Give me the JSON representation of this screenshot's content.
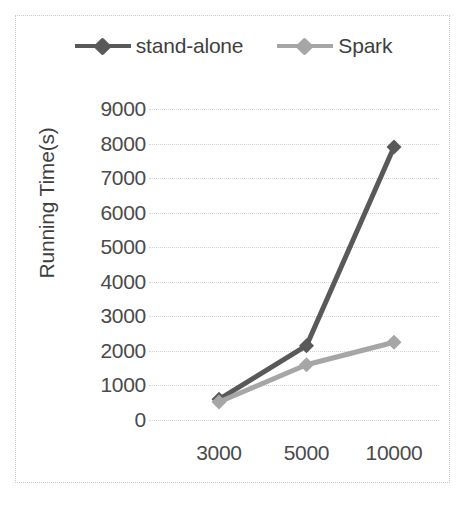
{
  "chart_data": {
    "type": "line",
    "title": "",
    "xlabel": "",
    "ylabel": "Running Time(s)",
    "categories": [
      "3000",
      "5000",
      "10000"
    ],
    "series": [
      {
        "name": "stand-alone",
        "values": [
          600,
          2150,
          7900
        ],
        "color": "#595959"
      },
      {
        "name": "Spark",
        "values": [
          520,
          1600,
          2250
        ],
        "color": "#a6a6a6"
      }
    ],
    "ylim": [
      0,
      9000
    ],
    "y_ticks": [
      "0",
      "1000",
      "2000",
      "3000",
      "4000",
      "5000",
      "6000",
      "7000",
      "8000",
      "9000"
    ],
    "grid": true,
    "legend_position": "top"
  },
  "legend": {
    "entries": [
      {
        "label": "stand-alone",
        "color": "#595959"
      },
      {
        "label": "Spark",
        "color": "#a6a6a6"
      }
    ]
  },
  "axes": {
    "y_title": "Running Time(s)"
  }
}
